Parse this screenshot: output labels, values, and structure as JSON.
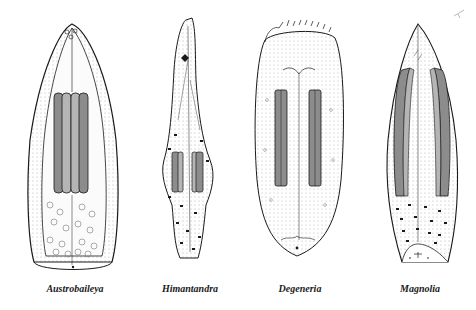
{
  "figure": {
    "specimens": [
      {
        "genus": "Austrobaileya"
      },
      {
        "genus": "Himantandra"
      },
      {
        "genus": "Degeneria"
      },
      {
        "genus": "Magnolia"
      }
    ]
  },
  "colors": {
    "outline": "#1a1a1a",
    "stipple": "#9a9a9a",
    "pollen_sac": "#8c8c8c",
    "pollen_sac_light": "#b5b5b5",
    "background": "#ffffff"
  }
}
